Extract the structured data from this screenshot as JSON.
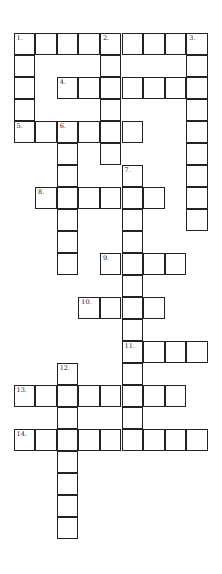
{
  "puzzle": {
    "type": "crossword",
    "cell_width": 21.6,
    "cell_height": 22,
    "entries": [
      {
        "number": "1.",
        "direction": "across",
        "row": 0,
        "col": 0,
        "length": 9
      },
      {
        "number": "1.",
        "direction": "down",
        "row": 0,
        "col": 0,
        "length": 5
      },
      {
        "number": "2.",
        "direction": "down",
        "row": 0,
        "col": 4,
        "length": 6
      },
      {
        "number": "3.",
        "direction": "down",
        "row": 0,
        "col": 8,
        "length": 9
      },
      {
        "number": "4.",
        "direction": "across",
        "row": 2,
        "col": 2,
        "length": 7
      },
      {
        "number": "5.",
        "direction": "across",
        "row": 4,
        "col": 0,
        "length": 6
      },
      {
        "number": "6.",
        "direction": "down",
        "row": 4,
        "col": 2,
        "length": 7
      },
      {
        "number": "7.",
        "direction": "down",
        "row": 6,
        "col": 5,
        "length": 13
      },
      {
        "number": "8.",
        "direction": "across",
        "row": 7,
        "col": 1,
        "length": 6
      },
      {
        "number": "9.",
        "direction": "across",
        "row": 10,
        "col": 4,
        "length": 4
      },
      {
        "number": "10.",
        "direction": "across",
        "row": 12,
        "col": 3,
        "length": 4
      },
      {
        "number": "11.",
        "direction": "across",
        "row": 14,
        "col": 5,
        "length": 4
      },
      {
        "number": "12.",
        "direction": "down",
        "row": 15,
        "col": 2,
        "length": 8
      },
      {
        "number": "13.",
        "direction": "across",
        "row": 16,
        "col": 0,
        "length": 8
      },
      {
        "number": "14.",
        "direction": "across",
        "row": 18,
        "col": 0,
        "length": 9
      }
    ]
  }
}
